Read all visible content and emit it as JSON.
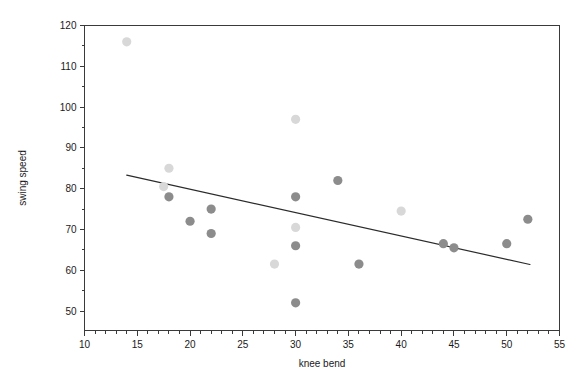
{
  "chart_data": {
    "type": "scatter",
    "title": "",
    "xlabel": "knee bend",
    "ylabel": "swing speed",
    "xlim": [
      10,
      55
    ],
    "ylim": [
      47,
      120
    ],
    "x_ticks": [
      10,
      15,
      20,
      25,
      30,
      35,
      40,
      45,
      50,
      55
    ],
    "x_tick_labels": [
      "10",
      "15",
      "20",
      "25",
      "30",
      "35",
      "40",
      "45",
      "50",
      "55"
    ],
    "x_minor_step": 1,
    "y_ticks": [
      50,
      60,
      70,
      80,
      90,
      100,
      110,
      120
    ],
    "y_tick_labels": [
      "50",
      "60",
      "70",
      "80",
      "90",
      "100",
      "110",
      "120"
    ],
    "y_minor_step": 5,
    "grid": false,
    "legend": null,
    "marker_radius": 4.6,
    "colors": {
      "marker_dark": "#8c8c8c",
      "marker_light": "#d8d8d8",
      "trend": "#2b2b2b",
      "axis": "#3a3a3a",
      "background": "#ffffff"
    },
    "points": [
      {
        "x": 14,
        "y": 116,
        "shade": "light"
      },
      {
        "x": 18,
        "y": 85,
        "shade": "light"
      },
      {
        "x": 17.5,
        "y": 80.5,
        "shade": "light"
      },
      {
        "x": 18,
        "y": 78,
        "shade": "dark"
      },
      {
        "x": 20,
        "y": 72,
        "shade": "dark"
      },
      {
        "x": 22,
        "y": 75,
        "shade": "dark"
      },
      {
        "x": 22,
        "y": 69,
        "shade": "dark"
      },
      {
        "x": 28,
        "y": 61.5,
        "shade": "light"
      },
      {
        "x": 30,
        "y": 97,
        "shade": "light"
      },
      {
        "x": 30,
        "y": 78,
        "shade": "dark"
      },
      {
        "x": 30,
        "y": 70.5,
        "shade": "light"
      },
      {
        "x": 30,
        "y": 66,
        "shade": "dark"
      },
      {
        "x": 30,
        "y": 52,
        "shade": "dark"
      },
      {
        "x": 34,
        "y": 82,
        "shade": "dark"
      },
      {
        "x": 36,
        "y": 61.5,
        "shade": "dark"
      },
      {
        "x": 40,
        "y": 74.5,
        "shade": "light"
      },
      {
        "x": 44,
        "y": 66.5,
        "shade": "dark"
      },
      {
        "x": 45,
        "y": 65.5,
        "shade": "dark"
      },
      {
        "x": 50,
        "y": 66.5,
        "shade": "dark"
      },
      {
        "x": 52,
        "y": 72.5,
        "shade": "dark"
      }
    ],
    "trend_line": {
      "x_start": 14,
      "y_start": 83.3,
      "x_end": 52.2,
      "y_end": 61.4
    }
  }
}
